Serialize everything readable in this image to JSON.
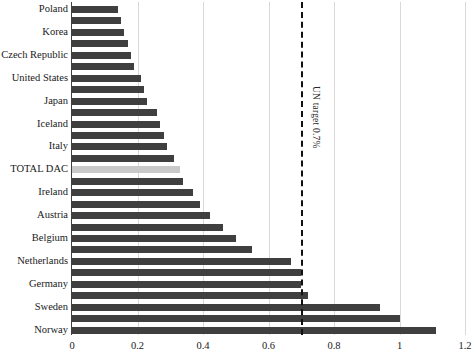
{
  "chart_data": {
    "type": "bar",
    "orientation": "horizontal",
    "title": "",
    "subtitle": "",
    "xlabel": "",
    "ylabel": "",
    "xlim": [
      0,
      1.2
    ],
    "xticks": [
      "0",
      "0.2",
      "0.4",
      "0.6",
      "0.8",
      "1",
      "1.2"
    ],
    "xtick_values": [
      0,
      0.2,
      0.4,
      0.6,
      0.8,
      1.0,
      1.2
    ],
    "grid": "vertical",
    "legend": "none",
    "bar_color": "#3f3f3f",
    "highlight_color": "#c9c9c9",
    "annotations": [
      {
        "name": "un-target-line",
        "text": "UN target 0.7%",
        "value": 0.7,
        "style": "dashed-vertical",
        "color": "#111111"
      }
    ],
    "categories": [
      "Poland",
      "",
      "Korea",
      "",
      "Czech Republic",
      "",
      "United States",
      "",
      "Japan",
      "",
      "Iceland",
      "",
      "Italy",
      "",
      "TOTAL DAC",
      "",
      "Ireland",
      "",
      "Austria",
      "",
      "Belgium",
      "",
      "Netherlands",
      "",
      "Germany",
      "",
      "Sweden",
      "",
      "Norway"
    ],
    "values": [
      0.14,
      0.15,
      0.16,
      0.17,
      0.18,
      0.19,
      0.21,
      0.22,
      0.23,
      0.26,
      0.27,
      0.28,
      0.29,
      0.31,
      0.33,
      0.34,
      0.37,
      0.39,
      0.42,
      0.46,
      0.5,
      0.55,
      0.67,
      0.7,
      0.7,
      0.72,
      0.94,
      1.0,
      1.11
    ],
    "labeled_categories": [
      "Poland",
      "Korea",
      "Czech Republic",
      "United States",
      "Japan",
      "Iceland",
      "Italy",
      "TOTAL DAC",
      "Ireland",
      "Austria",
      "Belgium",
      "Netherlands",
      "Germany",
      "Sweden",
      "Norway"
    ],
    "highlight_index": 14
  }
}
